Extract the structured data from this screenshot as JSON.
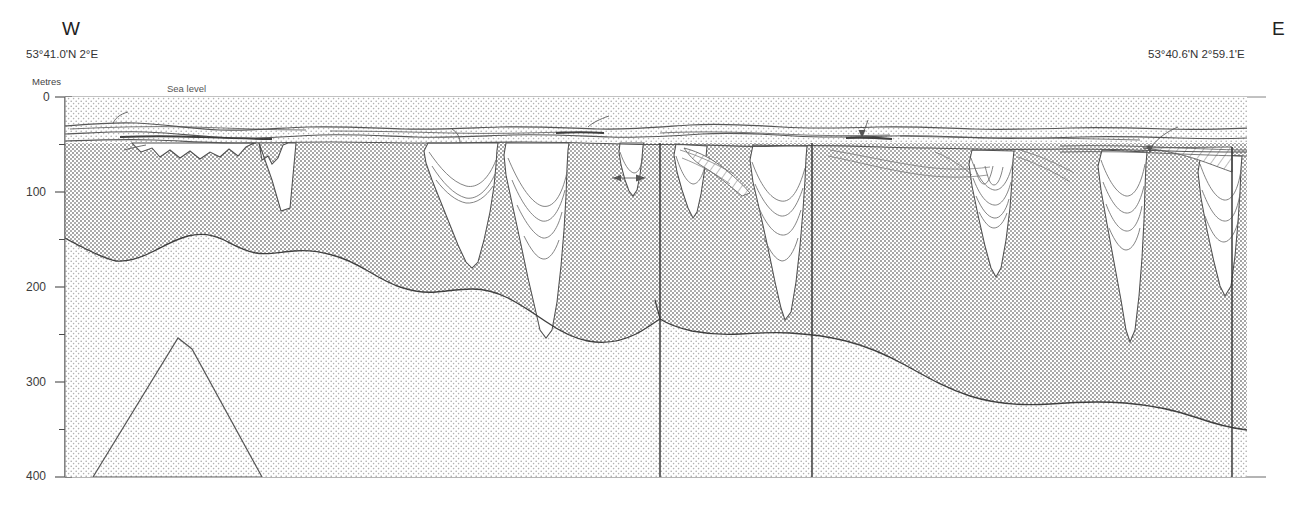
{
  "figure": {
    "type": "geological-cross-section",
    "orientation_left": "W",
    "orientation_right": "E",
    "coordinates_left": "53°41.0'N 2°E",
    "coordinates_right": "53°40.6'N 2°59.1'E",
    "sea_level_label": "Sea level",
    "depth_axis": {
      "title": "Metres",
      "ticks": [
        "0",
        "100",
        "200",
        "300",
        "400"
      ],
      "minor_ticks": [
        50,
        150,
        250,
        350
      ],
      "range": [
        0,
        400
      ],
      "units": "m"
    },
    "colors": {
      "line": "#4a4a4a",
      "stipple_dark": "#8d8d8d",
      "stipple_light": "#b8b8b8",
      "fill_white": "#ffffff",
      "background": "#ffffff",
      "text": "#383838"
    },
    "legend_units": [
      {
        "code": "qh",
        "name": "Holocene"
      },
      {
        "code": "EE",
        "name": "Eem Formation"
      },
      {
        "code": "BDK",
        "name": "Brown Bank / Dogger Kanaal"
      },
      {
        "code": "EG",
        "name": "Egmond Ground Formation"
      },
      {
        "code": "SBK",
        "name": "Swarte Bank Formation"
      },
      {
        "code": "P",
        "name": "Pleistocene"
      },
      {
        "code": "T",
        "name": "Tertiary"
      },
      {
        "code": "M",
        "name": "Salt diapir"
      }
    ],
    "annotations": [
      {
        "text": "qh",
        "x": 130,
        "y": 111,
        "leader": true
      },
      {
        "text": "qh",
        "x": 611,
        "y": 114,
        "leader": true
      },
      {
        "text": "qh",
        "x": 979,
        "y": 133,
        "leader": false
      },
      {
        "text": "EE",
        "x": 437,
        "y": 129,
        "leader": true
      },
      {
        "text": "EE",
        "x": 823,
        "y": 141,
        "leader": false
      },
      {
        "text": "BDK",
        "x": 570,
        "y": 131,
        "leader": false
      },
      {
        "text": "BDK",
        "x": 862,
        "y": 116,
        "leader": true
      },
      {
        "text": "EG",
        "x": 1180,
        "y": 126,
        "leader": true
      },
      {
        "text": "SBK",
        "x": 100,
        "y": 151,
        "leader": true
      },
      {
        "text": "SBK",
        "x": 272,
        "y": 147,
        "leader": false
      },
      {
        "text": "SBK",
        "x": 468,
        "y": 157,
        "leader": false
      },
      {
        "text": "SBK",
        "x": 595,
        "y": 179,
        "leader": true
      },
      {
        "text": "SBK",
        "x": 782,
        "y": 268,
        "leader": false
      },
      {
        "text": "SBK",
        "x": 991,
        "y": 240,
        "leader": false
      },
      {
        "text": "SBK",
        "x": 1117,
        "y": 243,
        "leader": false
      },
      {
        "text": "SBK",
        "x": 1219,
        "y": 268,
        "leader": false
      },
      {
        "text": "P",
        "x": 186,
        "y": 185,
        "leader": false
      },
      {
        "text": "P",
        "x": 380,
        "y": 211,
        "leader": false
      },
      {
        "text": "P",
        "x": 601,
        "y": 236,
        "leader": false
      },
      {
        "text": "P",
        "x": 713,
        "y": 257,
        "leader": false
      },
      {
        "text": "P",
        "x": 892,
        "y": 224,
        "leader": false
      },
      {
        "text": "P",
        "x": 1057,
        "y": 241,
        "leader": false
      },
      {
        "text": "P",
        "x": 1193,
        "y": 253,
        "leader": false
      },
      {
        "text": "T",
        "x": 417,
        "y": 380,
        "leader": false
      },
      {
        "text": "T",
        "x": 734,
        "y": 432,
        "leader": false
      },
      {
        "text": "T",
        "x": 983,
        "y": 443,
        "leader": false
      },
      {
        "text": "M",
        "x": 202,
        "y": 422,
        "leader": false
      }
    ],
    "faults": [
      {
        "name": "fault-1",
        "x_top": 660,
        "x_bottom": 660
      },
      {
        "name": "fault-2",
        "x_top": 812,
        "x_bottom": 812
      },
      {
        "name": "fault-3",
        "x_top": 1232,
        "x_bottom": 1232
      }
    ],
    "frame": {
      "left": 65,
      "right": 1247,
      "top": 97,
      "bottom": 477
    }
  }
}
